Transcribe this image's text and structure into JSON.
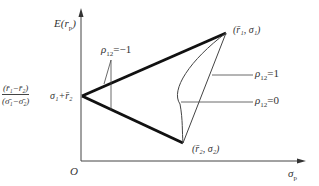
{
  "diagram": {
    "type": "portfolio-frontier",
    "y_axis_label": "E(r_p)",
    "x_axis_label": "σ_p",
    "origin_label": "O",
    "intercept_label": {
      "numerator": "(r̄1−r̄2)",
      "denominator": "(σ̄1−σ̄2)",
      "suffix": "σ1+r̄2"
    },
    "points": [
      {
        "id": "asset1",
        "label": "(r̄1, σ1)"
      },
      {
        "id": "asset2",
        "label": "(r̄2, σ2)"
      }
    ],
    "curves": [
      {
        "id": "rho-minus-1",
        "label": "ρ12=−1",
        "style": "thick"
      },
      {
        "id": "rho-plus-1",
        "label": "ρ12=1",
        "style": "thin-straight"
      },
      {
        "id": "rho-zero",
        "label": "ρ12=0",
        "style": "thin-curve"
      }
    ]
  },
  "labels": {
    "y_axis_main": "E(r",
    "y_axis_sub": "p",
    "y_axis_close": ")",
    "x_axis_main": "σ",
    "x_axis_sub": "p",
    "origin": "O",
    "frac_num": "(r̄₁−r̄₂)",
    "frac_den": "(σ̄₁−σ̄₂)",
    "frac_suffix": "σ₁+r̄₂",
    "point1": "(r̄₁, σ₁)",
    "point2": "(r̄₂, σ₂)",
    "rho_neg1_main": "ρ",
    "rho_neg1_sub": "12",
    "rho_neg1_val": "=−1",
    "rho_pos1_main": "ρ",
    "rho_pos1_sub": "12",
    "rho_pos1_val": "=1",
    "rho_zero_main": "ρ",
    "rho_zero_sub": "12",
    "rho_zero_val": "=0"
  }
}
